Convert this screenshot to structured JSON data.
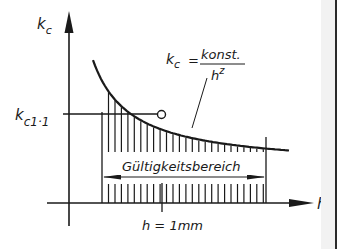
{
  "diagram": {
    "y_axis_label": {
      "main": "k",
      "sub": "c"
    },
    "x_axis_label": "h",
    "reference_value_label": {
      "main": "k",
      "sub": "c1·1"
    },
    "formula": {
      "lhs_main": "k",
      "lhs_sub": "c",
      "equals": "=",
      "numerator": "konst.",
      "denominator_main": "h",
      "denominator_sup": "z"
    },
    "range_label": "Gültigkeitsbereich",
    "reference_point_label": "h = 1mm",
    "colors": {
      "ink": "#1a1a1a",
      "background": "#ffffff",
      "right_band": "#f2f2f2"
    }
  },
  "chart_data": {
    "type": "line",
    "title": "",
    "xlabel": "h",
    "ylabel": "k_c",
    "function": "k_c = konst. / h^z",
    "annotations": [
      "k_c1·1 (value of k_c at h = 1 mm)",
      "Gültigkeitsbereich (validity range, hatched area with double arrow)",
      "h = 1mm"
    ],
    "series": [
      {
        "name": "k_c = konst./h^z",
        "shape": "decreasing hyperbolic curve"
      }
    ],
    "grid": false
  }
}
